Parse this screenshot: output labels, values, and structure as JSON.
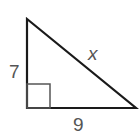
{
  "diagram": {
    "type": "right-triangle",
    "labels": {
      "vertical_leg": "7",
      "hypotenuse": "x",
      "horizontal_leg": "9"
    },
    "colors": {
      "stroke": "#1a1a1a",
      "right_angle_marker": "#555555",
      "label": "#555555"
    }
  }
}
